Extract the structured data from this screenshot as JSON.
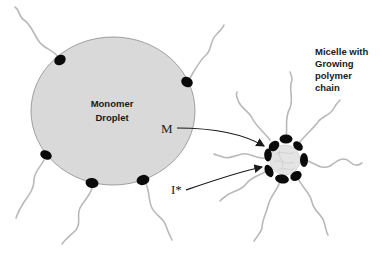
{
  "diagram": {
    "droplet": {
      "label_line1": "Monomer",
      "label_line2": "Droplet",
      "fill": "#d9d9d9",
      "outline": "#8a8a8a"
    },
    "micelle": {
      "label_line1": "Micelle with",
      "label_line2": "Growing",
      "label_line3": "polymer",
      "label_line4": "chain"
    },
    "arrows": [
      {
        "label": "M"
      },
      {
        "label": "I*"
      }
    ],
    "colors": {
      "surfactant_head": "#0a0a0a",
      "surfactant_tail": "#b9b9b9",
      "micelle_core": "#e4e4e4"
    }
  }
}
